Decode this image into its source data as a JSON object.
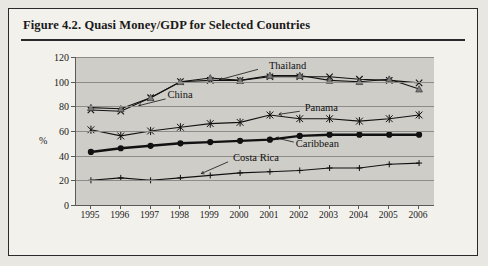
{
  "figure": {
    "title": "Figure 4.2.  Quasi Money/GDP for Selected Countries"
  },
  "chart_data": {
    "type": "line",
    "title": "Figure 4.2.  Quasi Money/GDP for Selected Countries",
    "xlabel": "",
    "ylabel": "%",
    "grid": true,
    "legend_position": "inline-annotations",
    "x": [
      "1995",
      "1996",
      "1997",
      "1998",
      "1999",
      "2000",
      "2001",
      "2002",
      "2003",
      "2004",
      "2005",
      "2006"
    ],
    "ylim": [
      0,
      120
    ],
    "yticks": [
      0,
      20,
      40,
      60,
      80,
      100,
      120
    ],
    "series": [
      {
        "name": "Thailand",
        "marker": "cross",
        "values": [
          77,
          76,
          87,
          100,
          101,
          101,
          104,
          104,
          104,
          102,
          101,
          99
        ]
      },
      {
        "name": "China",
        "marker": "triangle",
        "values": [
          79,
          78,
          87,
          100,
          103,
          101,
          105,
          105,
          101,
          100,
          102,
          94
        ]
      },
      {
        "name": "Panama",
        "marker": "asterisk",
        "values": [
          61,
          56,
          60,
          63,
          66,
          67,
          73,
          70,
          70,
          68,
          70,
          73
        ]
      },
      {
        "name": "Caribbean",
        "marker": "filled-circle",
        "values": [
          43,
          46,
          48,
          50,
          51,
          52,
          53,
          56,
          57,
          57,
          57,
          57
        ]
      },
      {
        "name": "Costa Rica",
        "marker": "plus",
        "values": [
          20,
          22,
          20,
          22,
          24,
          26,
          27,
          28,
          30,
          30,
          33,
          34
        ]
      }
    ],
    "annotations": [
      {
        "text": "Thailand",
        "x": 2001,
        "y": 112
      },
      {
        "text": "China",
        "x": 1997.6,
        "y": 88
      },
      {
        "text": "Panama",
        "x": 2002.2,
        "y": 78
      },
      {
        "text": "Caribbean",
        "x": 2001.9,
        "y": 49
      },
      {
        "text": "Costa Rica",
        "x": 1999.8,
        "y": 37
      }
    ]
  }
}
